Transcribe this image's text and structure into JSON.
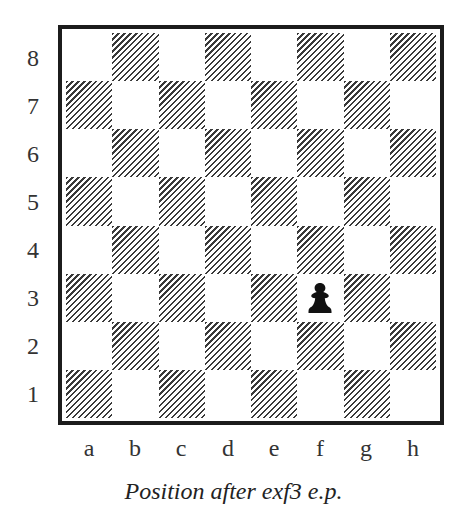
{
  "diagram": {
    "type": "chess-board",
    "caption": "Position after exf3 e.p.",
    "ranks": [
      "8",
      "7",
      "6",
      "5",
      "4",
      "3",
      "2",
      "1"
    ],
    "files": [
      "a",
      "b",
      "c",
      "d",
      "e",
      "f",
      "g",
      "h"
    ],
    "square_style": {
      "light": "plain",
      "dark": "diagonal-hatch"
    },
    "pieces": [
      {
        "square": "f3",
        "piece": "pawn",
        "color": "black"
      }
    ]
  }
}
